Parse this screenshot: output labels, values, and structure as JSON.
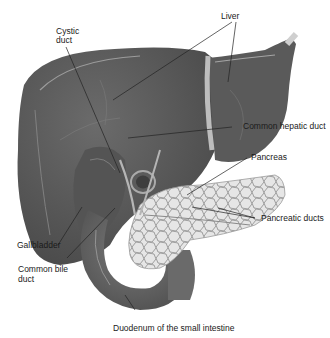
{
  "diagram": {
    "type": "anatomical illustration",
    "labels": {
      "liver": "Liver",
      "cystic_duct_line1": "Cystic",
      "cystic_duct_line2": "duct",
      "common_hepatic_duct": "Common hepatic duct",
      "pancreas": "Pancreas",
      "pancreatic_ducts": "Pancreatic ducts",
      "gallbladder": "Gallbladder",
      "common_bile_duct_line1": "Common bile",
      "common_bile_duct_line2": "duct",
      "duodenum": "Duodenum of the small intestine"
    },
    "colors": {
      "liver": "#5e5e5e",
      "liver_dark": "#4a4a4a",
      "pancreas": "#e4e4e4",
      "pancreas_cells": "#8f8f8f",
      "duodenum": "#6a6a6a",
      "leader_line": "#222222"
    }
  }
}
